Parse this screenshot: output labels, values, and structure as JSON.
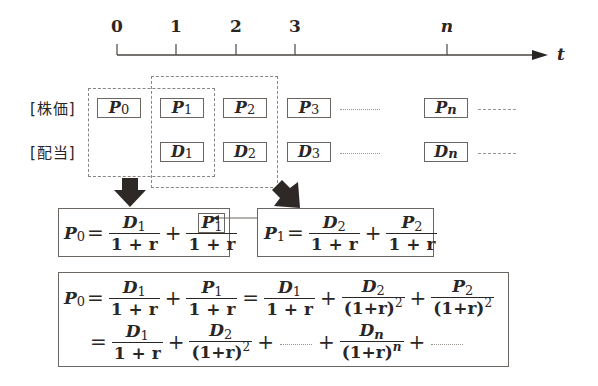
{
  "timeline": {
    "ticks": [
      {
        "label": "0",
        "x": 117
      },
      {
        "label": "1",
        "x": 176
      },
      {
        "label": "2",
        "x": 236
      },
      {
        "label": "3",
        "x": 295
      },
      {
        "label": "n",
        "x": 447
      }
    ],
    "axis_label": "t"
  },
  "rows": {
    "price_label": "[株価]",
    "dividend_label": "[配当]"
  },
  "price_cells": [
    {
      "var": "P",
      "sub": "0"
    },
    {
      "var": "P",
      "sub": "1"
    },
    {
      "var": "P",
      "sub": "2"
    },
    {
      "var": "P",
      "sub": "3"
    },
    {
      "var": "P",
      "sub": "n"
    }
  ],
  "dividend_cells": [
    {
      "var": "D",
      "sub": "1"
    },
    {
      "var": "D",
      "sub": "2"
    },
    {
      "var": "D",
      "sub": "3"
    },
    {
      "var": "D",
      "sub": "n"
    }
  ],
  "equation_left": {
    "lhs_var": "P",
    "lhs_sub": "0",
    "eq": "=",
    "t1_num_var": "D",
    "t1_num_sub": "1",
    "t1_den": "1 + r",
    "plus": "+",
    "t2_num_var": "P",
    "t2_num_sub": "1",
    "t2_den": "1 + r"
  },
  "equation_right": {
    "lhs_var": "P",
    "lhs_sub": "1",
    "eq": "=",
    "t1_num_var": "D",
    "t1_num_sub": "2",
    "t1_den": "1 + r",
    "plus": "+",
    "t2_num_var": "P",
    "t2_num_sub": "2",
    "t2_den": "1 + r"
  },
  "equation_bottom": {
    "line1": {
      "lhs_var": "P",
      "lhs_sub": "0",
      "eq": "=",
      "plus": "+",
      "a_num_var": "D",
      "a_num_sub": "1",
      "a_den": "1 + r",
      "b_num_var": "P",
      "b_num_sub": "1",
      "b_den": "1 + r",
      "c_num_var": "D",
      "c_num_sub": "1",
      "c_den": "1 + r",
      "d_num_var": "D",
      "d_num_sub": "2",
      "d_den": "(1+r)",
      "d_exp": "2",
      "e_num_var": "P",
      "e_num_sub": "2",
      "e_den": "(1+r)",
      "e_exp": "2"
    },
    "line2": {
      "eq": "=",
      "plus": "+",
      "a_num_var": "D",
      "a_num_sub": "1",
      "a_den": "1 + r",
      "b_num_var": "D",
      "b_num_sub": "2",
      "b_den": "(1+r)",
      "b_exp": "2",
      "c_num_var": "D",
      "c_num_sub": "n",
      "c_den": "(1+r)",
      "c_exp": "n"
    }
  }
}
